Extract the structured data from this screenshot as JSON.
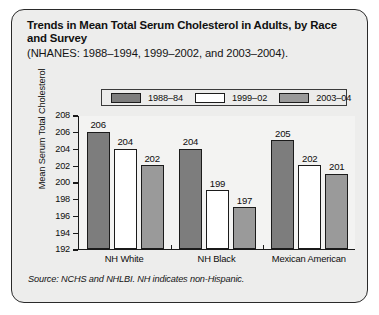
{
  "card": {
    "title": "Trends in Mean Total Serum Cholesterol in Adults, by Race and Survey",
    "subtitle": "(NHANES: 1988–1994, 1999–2002, and 2003–2004).",
    "source_note": "Source: NCHS and NHLBI. NH indicates non-Hispanic."
  },
  "colors": {
    "series_1988_84": "#7d7d7d",
    "series_1999_02": "#ffffff",
    "series_2003_04": "#9a9a9a",
    "outline": "#1b1b1b",
    "card_background": "#ededec",
    "plot_background": "#f3f3f2",
    "text": "#0d0d0d"
  },
  "chart_data": {
    "type": "bar",
    "title": "Trends in Mean Total Serum Cholesterol in Adults, by Race and Survey",
    "subtitle": "(NHANES: 1988–1994, 1999–2002, and 2003–2004).",
    "xlabel": "",
    "ylabel": "Mean Serum Total Cholesterol",
    "ylim": [
      192,
      208
    ],
    "ytick_labels": [
      "208",
      "206",
      "204",
      "202",
      "200",
      "198",
      "196",
      "194",
      "192"
    ],
    "yticks": [
      208,
      206,
      204,
      202,
      200,
      198,
      196,
      194,
      192
    ],
    "grid": false,
    "legend_position": "top-center",
    "categories": [
      "NH White",
      "NH Black",
      "Mexican American"
    ],
    "series": [
      {
        "name": "1988–84",
        "values": [
          206,
          204,
          205
        ],
        "color": "#7d7d7d"
      },
      {
        "name": "1999–02",
        "values": [
          204,
          199,
          202
        ],
        "color": "#ffffff"
      },
      {
        "name": "2003–04",
        "values": [
          202,
          197,
          201
        ],
        "color": "#9a9a9a"
      }
    ],
    "data_labels": [
      [
        "206",
        "204",
        "202"
      ],
      [
        "204",
        "199",
        "197"
      ],
      [
        "205",
        "202",
        "201"
      ]
    ]
  }
}
